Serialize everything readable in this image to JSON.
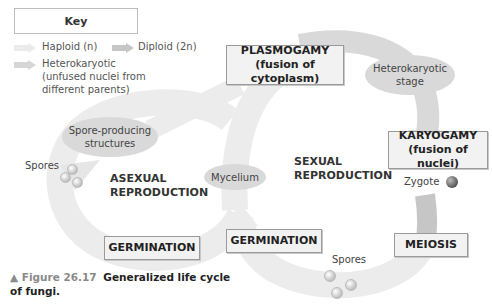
{
  "key": {
    "title": "Key",
    "items": [
      {
        "label": "Haploid (n)",
        "color": "#ebebeb"
      },
      {
        "label": "Diploid (2n)",
        "color": "#c6c6c6"
      },
      {
        "label": "Heterokaryotic (unfused nuclei from different parents)",
        "lines": [
          "Heterokaryotic",
          "(unfused nuclei from",
          "different parents)"
        ],
        "color": "#d6d6d6"
      }
    ]
  },
  "stages": {
    "plasmogamy": {
      "title": "PLASMOGAMY",
      "subtitle": "(fusion of cytoplasm)"
    },
    "heterokaryotic": {
      "line1": "Heterokaryotic",
      "line2": "stage"
    },
    "karyogamy": {
      "title": "KARYOGAMY",
      "subtitle": "(fusion of nuclei)"
    },
    "zygote": "Zygote",
    "meiosis": "MEIOSIS",
    "germination_sexual": "GERMINATION",
    "germination_asexual": "GERMINATION",
    "spores_sexual": "Spores",
    "spores_asexual": "Spores",
    "spore_structures": {
      "line1": "Spore-producing",
      "line2": "structures"
    },
    "mycelium": "Mycelium"
  },
  "regions": {
    "asexual": {
      "line1": "ASEXUAL",
      "line2": "REPRODUCTION"
    },
    "sexual": {
      "line1": "SEXUAL",
      "line2": "REPRODUCTION"
    }
  },
  "caption": {
    "figure": "▲ Figure 26.17",
    "title_line1": "Generalized life cycle",
    "title_line2": "of fungi."
  },
  "colors": {
    "haploid": "#ebebeb",
    "diploid": "#c6c6c6",
    "heterokaryotic": "#d6d6d6",
    "box_fill": "#f2f2f2",
    "ellipse_fill": "#d9d9d9"
  }
}
